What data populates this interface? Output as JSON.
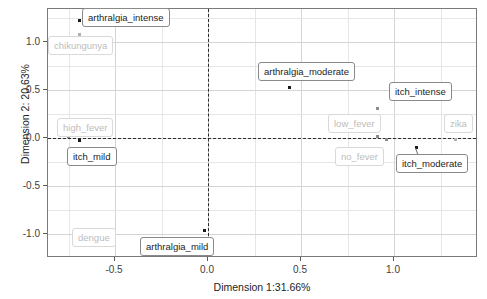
{
  "chart_data": {
    "type": "scatter",
    "title": "",
    "xlabel": "Dimension 1:31.66%",
    "ylabel": "Dimension 2: 20.63%",
    "xlim": [
      -0.83,
      1.47
    ],
    "ylim": [
      -1.35,
      1.35
    ],
    "xticks": [
      -0.5,
      0.0,
      0.5,
      1.0
    ],
    "xticklabels": [
      "-0.5",
      "0.0",
      "0.5",
      "1.0"
    ],
    "yticks": [
      1.0,
      0.5,
      0.0,
      -0.5,
      -1.0
    ],
    "yticklabels": [
      "1.0",
      "0.5",
      "0.0",
      "-0.5",
      "-1.0"
    ],
    "grid": true,
    "legend": "none",
    "reference_lines": [
      {
        "axis": "vertical",
        "value": 0.0,
        "style": "dashed"
      },
      {
        "axis": "horizontal",
        "value": 0.0,
        "style": "dashed"
      }
    ],
    "points": [
      {
        "label": "arthralgia_intense",
        "x": -0.69,
        "y": 1.22,
        "group": "variable",
        "label_style": "dark"
      },
      {
        "label": "chikungunya",
        "x": -0.69,
        "y": 1.08,
        "group": "individual",
        "label_style": "light"
      },
      {
        "label": "high_fever",
        "x": -0.75,
        "y": 0.02,
        "group": "level",
        "label_style": "light"
      },
      {
        "label": "itch_mild",
        "x": -0.69,
        "y": -0.03,
        "group": "variable",
        "label_style": "dark"
      },
      {
        "label": "dengue",
        "x": -0.62,
        "y": -1.12,
        "group": "individual",
        "label_style": "light"
      },
      {
        "label": "arthralgia_mild",
        "x": -0.02,
        "y": -0.96,
        "group": "variable",
        "label_style": "dark"
      },
      {
        "label": "arthralgia_moderate",
        "x": 0.44,
        "y": 0.53,
        "group": "variable",
        "label_style": "dark"
      },
      {
        "label": "itch_intense",
        "x": 0.91,
        "y": 0.31,
        "group": "level",
        "label_style": "dark"
      },
      {
        "label": "low_fever",
        "x": 0.91,
        "y": 0.02,
        "group": "level",
        "label_style": "light"
      },
      {
        "label": "no_fever",
        "x": 0.96,
        "y": -0.02,
        "group": "level",
        "label_style": "light"
      },
      {
        "label": "zika",
        "x": 1.33,
        "y": -0.02,
        "group": "individual",
        "label_style": "light"
      },
      {
        "label": "itch_moderate",
        "x": 1.12,
        "y": -0.1,
        "group": "variable",
        "label_style": "dark"
      }
    ],
    "label_boxes": [
      {
        "label": "arthralgia_intense",
        "left": 82,
        "top": 8,
        "style": "dark"
      },
      {
        "label": "chikungunya",
        "left": 48,
        "top": 36,
        "style": "light"
      },
      {
        "label": "high_fever",
        "left": 57,
        "top": 118,
        "style": "light"
      },
      {
        "label": "itch_mild",
        "left": 67,
        "top": 147,
        "style": "dark"
      },
      {
        "label": "dengue",
        "left": 72,
        "top": 228,
        "style": "light"
      },
      {
        "label": "arthralgia_mild",
        "left": 140,
        "top": 237,
        "style": "dark"
      },
      {
        "label": "arthralgia_moderate",
        "left": 258,
        "top": 62,
        "style": "dark"
      },
      {
        "label": "itch_intense",
        "left": 389,
        "top": 82,
        "style": "dark"
      },
      {
        "label": "low_fever",
        "left": 328,
        "top": 114,
        "style": "light"
      },
      {
        "label": "zika",
        "left": 444,
        "top": 114,
        "style": "light"
      },
      {
        "label": "no_fever",
        "left": 335,
        "top": 147,
        "style": "light"
      },
      {
        "label": "itch_moderate",
        "left": 396,
        "top": 154,
        "style": "dark"
      }
    ],
    "colors": {
      "variable_point": "#1a1a1a",
      "level_point": "#8c8c8c",
      "individual_point": "#b0b0b0",
      "dark_label_text": "#1d1d1d",
      "light_label_text": "#bdbdbd",
      "grid": "#d4d4d4",
      "panel_border": "#7a7a7a",
      "reference_line": "#2b2b2b"
    }
  }
}
